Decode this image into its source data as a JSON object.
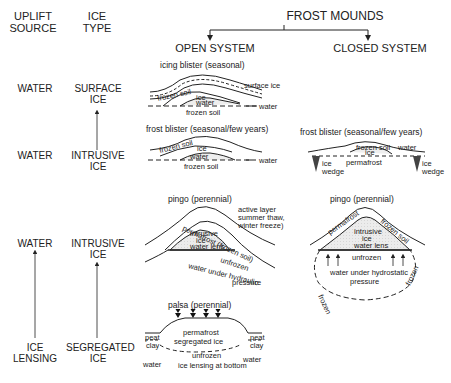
{
  "title": "FROST MOUNDS",
  "columns": {
    "uplift_source": "UPLIFT\nSOURCE",
    "ice_type": "ICE\nTYPE",
    "open_system": "OPEN SYSTEM",
    "closed_system": "CLOSED SYSTEM"
  },
  "rows": [
    {
      "uplift_source": "WATER",
      "ice_type": "SURFACE ICE",
      "open": {
        "title": "icing blister (seasonal)",
        "labels": [
          "surface ice",
          "frozen soil",
          "ice",
          "water",
          "frozen soil",
          "water"
        ]
      },
      "closed": null
    },
    {
      "uplift_source": "WATER",
      "ice_type": "INTRUSIVE ICE",
      "open": {
        "title": "frost blister (seasonal/few years)",
        "labels": [
          "frozen soil",
          "ice",
          "water",
          "frozen soil",
          "water"
        ]
      },
      "closed": {
        "title": "frost blister (seasonal/few years)",
        "labels": [
          "frozen soil",
          "ice",
          "water",
          "permafrost",
          "ice wedge",
          "ice wedge"
        ]
      }
    },
    {
      "uplift_source": "WATER",
      "ice_type": "INTRUSIVE ICE",
      "open": {
        "title": "pingo (perennial)",
        "labels": [
          "active layer",
          "summer thaw,",
          "winter freeze)",
          "permafrost (frozen soil)",
          "intrusive",
          "ice",
          "water lens",
          "unfrozen",
          "water under hydraulic",
          "pressure"
        ]
      },
      "closed": {
        "title": "pingo (perennial)",
        "labels": [
          "permafrost",
          "frozen soil",
          "intrusive",
          "ice",
          "water lens",
          "unfrozen",
          "water under hydrostatic",
          "pressure",
          "frozen",
          "frozen"
        ]
      }
    },
    {
      "uplift_source": "ICE LENSING",
      "ice_type": "SEGREGATED ICE",
      "open": {
        "title": "palsa (perennial)",
        "labels": [
          "peat",
          "clay",
          "permafrost",
          "segregated ice",
          "unfrozen",
          "peat",
          "clay",
          "water",
          "water",
          "ice lensing at bottom"
        ]
      },
      "closed": null
    }
  ],
  "colors": {
    "ink": "#222222",
    "shade": "#e4e4e4",
    "background": "#ffffff"
  }
}
